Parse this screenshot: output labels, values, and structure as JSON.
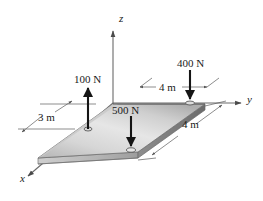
{
  "figure": {
    "background_color": "#ffffff",
    "line_color": "#1a1a1a",
    "plate_top_color_light": "#e2e2e2",
    "plate_top_color_dark": "#9a9a9a",
    "plate_edge_color": "#6f6f6f",
    "plate_side_color": "#b9b9b9"
  },
  "axes": [
    {
      "name": "z-axis",
      "label": "z",
      "label_x": 119,
      "label_y": 22,
      "direction": "up"
    },
    {
      "name": "y-axis",
      "label": "y",
      "label_x": 247,
      "label_y": 103,
      "direction": "right"
    },
    {
      "name": "x-axis",
      "label": "x",
      "label_x": 20,
      "label_y": 182,
      "direction": "lower-left"
    }
  ],
  "forces": [
    {
      "name": "force-100n",
      "label": "100 N",
      "magnitude": 100,
      "unit": "N",
      "direction": "up",
      "label_x": 74,
      "label_y": 83,
      "arrow_x": 88,
      "arrow_tail_y": 129,
      "arrow_head_y": 86
    },
    {
      "name": "force-500n",
      "label": "500 N",
      "magnitude": 500,
      "unit": "N",
      "direction": "down",
      "label_x": 112,
      "label_y": 114,
      "arrow_x": 131,
      "arrow_tail_y": 116,
      "arrow_head_y": 150
    },
    {
      "name": "force-400n",
      "label": "400 N",
      "magnitude": 400,
      "unit": "N",
      "direction": "down",
      "label_x": 177,
      "label_y": 67,
      "arrow_x": 190,
      "arrow_tail_y": 70,
      "arrow_head_y": 101
    }
  ],
  "dimensions": [
    {
      "name": "dimension-3m-left",
      "label": "3 m",
      "value": 3,
      "unit": "m",
      "label_x": 38,
      "label_y": 121,
      "orientation": "horizontal"
    },
    {
      "name": "dimension-4m-top",
      "label": "4 m",
      "value": 4,
      "unit": "m",
      "label_x": 159,
      "label_y": 91,
      "orientation": "horizontal"
    },
    {
      "name": "dimension-4m-right",
      "label": "4 m",
      "value": 4,
      "unit": "m",
      "label_x": 182,
      "label_y": 128,
      "orientation": "diagonal"
    }
  ]
}
